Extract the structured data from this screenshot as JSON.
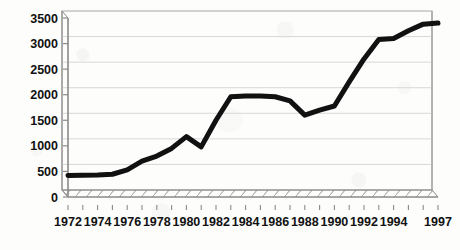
{
  "chart_data": {
    "type": "line",
    "title": "",
    "subtitle": "",
    "xlabel": "",
    "ylabel": "",
    "grid": true,
    "legend": "none",
    "style": "3d-scanned-line-chart",
    "xlim": [
      1972,
      1997
    ],
    "ylim": [
      0,
      3500
    ],
    "yticks": [
      0,
      500,
      1000,
      1500,
      2000,
      2500,
      3000,
      3500
    ],
    "ytick_labels": [
      "0",
      "500",
      "1000",
      "1500",
      "2000",
      "2500",
      "3000",
      "3500"
    ],
    "xtick_labels": [
      "1972",
      "1974",
      "1976",
      "1978",
      "1980",
      "1982",
      "1984",
      "1986",
      "1988",
      "1990",
      "1992",
      "1994",
      "1997"
    ],
    "xtick_label_years": [
      1972,
      1974,
      1976,
      1978,
      1980,
      1982,
      1984,
      1986,
      1988,
      1990,
      1992,
      1994,
      1997
    ],
    "minor_tick_years": [
      1972,
      1973,
      1974,
      1975,
      1976,
      1977,
      1978,
      1979,
      1980,
      1981,
      1982,
      1983,
      1984,
      1985,
      1986,
      1987,
      1988,
      1989,
      1990,
      1991,
      1992,
      1993,
      1994,
      1995,
      1996,
      1997
    ],
    "series": [
      {
        "name": "value",
        "x": [
          1972,
          1973,
          1974,
          1975,
          1976,
          1977,
          1978,
          1979,
          1980,
          1981,
          1982,
          1983,
          1984,
          1985,
          1986,
          1987,
          1988,
          1989,
          1990,
          1991,
          1992,
          1993,
          1994,
          1995,
          1996,
          1997
        ],
        "values": [
          420,
          425,
          430,
          445,
          530,
          700,
          800,
          950,
          1180,
          980,
          1500,
          1960,
          1975,
          1975,
          1960,
          1880,
          1600,
          1700,
          1780,
          2250,
          2700,
          3080,
          3100,
          3250,
          3380,
          3400
        ],
        "color": "#111111",
        "line_width": 5
      }
    ],
    "colors": {
      "line": "#111111",
      "grid": "#d8d8d8",
      "axis": "#8a8a8a",
      "frame": "#9a9a9a",
      "background": "#fdfdfc",
      "tick_label": "#111111"
    }
  }
}
